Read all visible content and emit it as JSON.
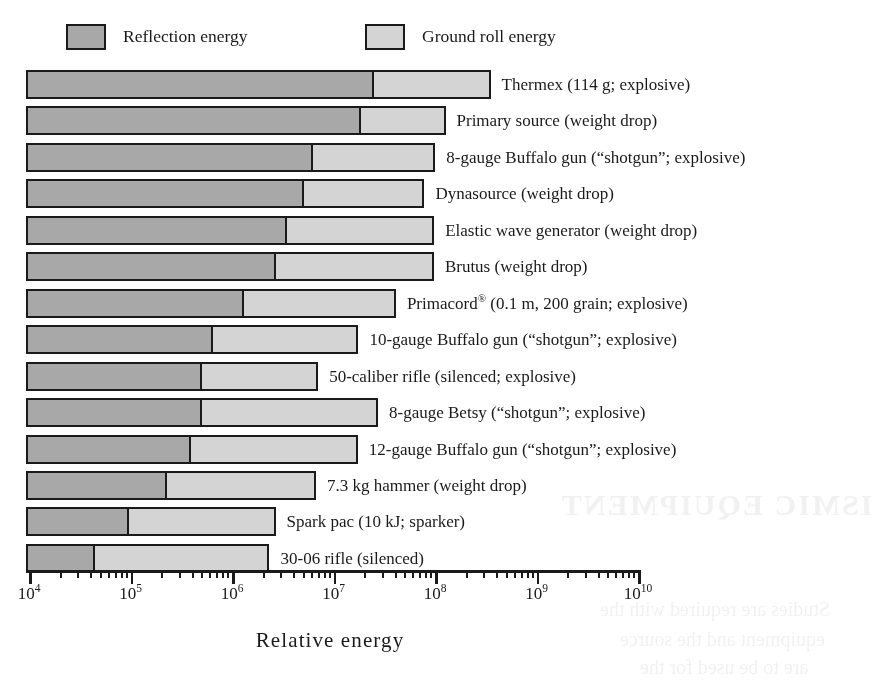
{
  "legend": {
    "items": [
      {
        "label": "Reflection energy",
        "color": "#a8a8a8",
        "name": "reflection-energy"
      },
      {
        "label": "Ground roll energy",
        "color": "#d4d4d4",
        "name": "ground-roll-energy"
      }
    ]
  },
  "axis": {
    "title": "Relative energy",
    "tick_labels": [
      {
        "mantissa": "10",
        "exponent": "4"
      },
      {
        "mantissa": "10",
        "exponent": "5"
      },
      {
        "mantissa": "10",
        "exponent": "6"
      },
      {
        "mantissa": "10",
        "exponent": "7"
      },
      {
        "mantissa": "10",
        "exponent": "8"
      },
      {
        "mantissa": "10",
        "exponent": "9"
      },
      {
        "mantissa": "10",
        "exponent": "10"
      }
    ]
  },
  "rows": [
    {
      "label": "Thermex (114 g; explosive)",
      "label_html": "Thermex (114 g; explosive)"
    },
    {
      "label": "Primary source (weight drop)",
      "label_html": "Primary source (weight drop)"
    },
    {
      "label": "8-gauge Buffalo gun (“shotgun”; explosive)",
      "label_html": "8-gauge Buffalo gun (“shotgun”; explosive)"
    },
    {
      "label": "Dynasource (weight drop)",
      "label_html": "Dynasource (weight drop)"
    },
    {
      "label": "Elastic wave generator (weight drop)",
      "label_html": "Elastic wave generator (weight drop)"
    },
    {
      "label": "Brutus (weight drop)",
      "label_html": "Brutus (weight drop)"
    },
    {
      "label": "Primacord® (0.1 m, 200 grain; explosive)",
      "label_html": "Primacord<sup>®</sup> (0.1 m, 200 grain; explosive)"
    },
    {
      "label": "10-gauge Buffalo gun (“shotgun”; explosive)",
      "label_html": "10-gauge Buffalo gun (“shotgun”; explosive)"
    },
    {
      "label": "50-caliber rifle (silenced; explosive)",
      "label_html": "50-caliber rifle (silenced; explosive)"
    },
    {
      "label": "8-gauge Betsy (“shotgun”; explosive)",
      "label_html": "8-gauge Betsy (“shotgun”; explosive)"
    },
    {
      "label": "12-gauge Buffalo gun (“shotgun”; explosive)",
      "label_html": "12-gauge Buffalo gun (“shotgun”; explosive)"
    },
    {
      "label": "7.3 kg hammer (weight drop)",
      "label_html": "7.3 kg hammer (weight drop)"
    },
    {
      "label": "Spark pac (10 kJ; sparker)",
      "label_html": "Spark pac (10 kJ; sparker)"
    },
    {
      "label": "30-06 rifle (silenced)",
      "label_html": "30-06 rifle (silenced)"
    }
  ],
  "chart_data": {
    "type": "bar",
    "orientation": "horizontal",
    "stacked": true,
    "log_scale": true,
    "title": "",
    "xlabel": "Relative energy",
    "ylabel": "",
    "xlim": [
      10000,
      10000000000
    ],
    "xticks": [
      10000,
      100000,
      1000000,
      10000000,
      100000000,
      1000000000,
      10000000000
    ],
    "xtick_labels": [
      "10^4",
      "10^5",
      "10^6",
      "10^7",
      "10^8",
      "10^9",
      "10^10"
    ],
    "grid": false,
    "legend_position": "top",
    "categories": [
      "Thermex (114 g; explosive)",
      "Primary source (weight drop)",
      "8-gauge Buffalo gun (“shotgun”; explosive)",
      "Dynasource (weight drop)",
      "Elastic wave generator (weight drop)",
      "Brutus (weight drop)",
      "Primacord® (0.1 m, 200 grain; explosive)",
      "10-gauge Buffalo gun (“shotgun”; explosive)",
      "50-caliber rifle (silenced; explosive)",
      "8-gauge Betsy (“shotgun”; explosive)",
      "12-gauge Buffalo gun (“shotgun”; explosive)",
      "7.3 kg hammer (weight drop)",
      "Spark pac (10 kJ; sparker)",
      "30-06 rifle (silenced)"
    ],
    "series": [
      {
        "name": "Reflection energy",
        "color": "#a8a8a8",
        "values": [
          23000000.0,
          17000000.0,
          5800000.0,
          4700000.0,
          3200000.0,
          2500000.0,
          1200000.0,
          600000.0,
          460000.0,
          460000.0,
          360000.0,
          210000.0,
          89000.0,
          41000.0
        ]
      },
      {
        "name": "Ground roll energy",
        "color": "#d4d4d4",
        "values": [
          330000000.0,
          110000000.0,
          95000000.0,
          74000000.0,
          95000000.0,
          95000000.0,
          40000000.0,
          17000000.0,
          6600000.0,
          27000000.0,
          17000000.0,
          6500000.0,
          2600000.0,
          2300000.0
        ]
      }
    ],
    "cumulative_totals": [
      350000000.0,
      130000000.0,
      100000000.0,
      79000000.0,
      100000000.0,
      100000000.0,
      41000000.0,
      18000000.0,
      7100000.0,
      27000000.0,
      18000000.0,
      6700000.0,
      2700000.0,
      2400000.0
    ]
  }
}
